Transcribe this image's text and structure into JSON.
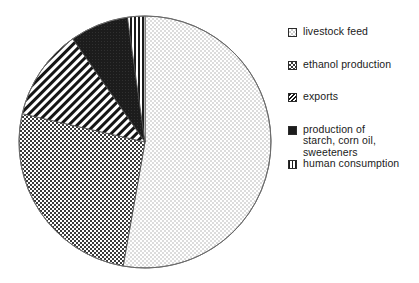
{
  "chart_data": {
    "type": "pie",
    "title": "",
    "subtitle": "",
    "xlabel": "",
    "ylabel": "",
    "grid": false,
    "legend_position": "right",
    "start_angle_deg": 0,
    "direction": "clockwise",
    "categories": [
      "livestock feed",
      "ethanol production",
      "exports",
      "production of\nstarch, corn oil,\nsweeteners",
      "human consumption"
    ],
    "values": [
      44,
      26,
      12,
      8,
      3
    ],
    "slices": [
      {
        "label": "livestock feed",
        "value": 44,
        "pattern": "light-dots",
        "start_deg": 0,
        "end_deg": 190,
        "fill": "#f2f2f2",
        "ink": "#8a8a8a"
      },
      {
        "label": "ethanol production",
        "value": 26,
        "pattern": "medium-dots",
        "start_deg": 190,
        "end_deg": 283,
        "fill": "#ffffff",
        "ink": "#3a3a3a"
      },
      {
        "label": "exports",
        "value": 12,
        "pattern": "diagonal-stripes",
        "start_deg": 283,
        "end_deg": 325,
        "fill": "#ffffff",
        "ink": "#1a1a1a"
      },
      {
        "label": "production of starch, corn oil, sweeteners",
        "value": 8,
        "pattern": "solid-black",
        "start_deg": 325,
        "end_deg": 352,
        "fill": "#1c1c1c",
        "ink": "#000000"
      },
      {
        "label": "human consumption",
        "value": 3,
        "pattern": "vertical-lines",
        "start_deg": 352,
        "end_deg": 360,
        "fill": "#ffffff",
        "ink": "#1a1a1a"
      }
    ]
  },
  "legend": {
    "items": [
      {
        "label": "livestock feed",
        "swatch": "light-dots-swatch"
      },
      {
        "label": "ethanol production",
        "swatch": "medium-dots-swatch"
      },
      {
        "label": "exports",
        "swatch": "diagonal-stripes-swatch"
      },
      {
        "label": "production of\nstarch, corn oil,\nsweeteners",
        "swatch": "solid-black-swatch"
      },
      {
        "label": "human consumption",
        "swatch": "vertical-lines-swatch"
      }
    ]
  },
  "colors": {
    "outline": "#555555",
    "text": "#1a1a1a",
    "background": "#ffffff"
  }
}
